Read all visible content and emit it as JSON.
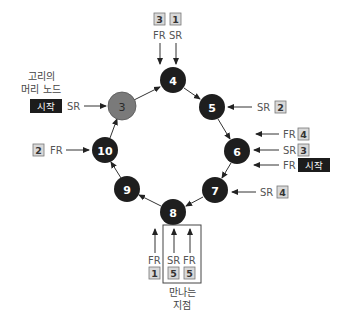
{
  "diagram": {
    "type": "cyclic-linked-list-floyd",
    "nodes": [
      {
        "id": "n3",
        "label": "3",
        "cx": 122,
        "cy": 106,
        "style": "start"
      },
      {
        "id": "n4",
        "label": "4",
        "cx": 173,
        "cy": 80,
        "style": "dark"
      },
      {
        "id": "n5",
        "label": "5",
        "cx": 212,
        "cy": 107,
        "style": "dark"
      },
      {
        "id": "n6",
        "label": "6",
        "cx": 237,
        "cy": 151,
        "style": "dark"
      },
      {
        "id": "n7",
        "label": "7",
        "cx": 215,
        "cy": 190,
        "style": "dark"
      },
      {
        "id": "n8",
        "label": "8",
        "cx": 173,
        "cy": 212,
        "style": "dark"
      },
      {
        "id": "n9",
        "label": "9",
        "cx": 127,
        "cy": 189,
        "style": "dark"
      },
      {
        "id": "n10",
        "label": "10",
        "cx": 105,
        "cy": 150,
        "style": "dark"
      }
    ],
    "edges": [
      [
        "n3",
        "n4"
      ],
      [
        "n4",
        "n5"
      ],
      [
        "n5",
        "n6"
      ],
      [
        "n6",
        "n7"
      ],
      [
        "n7",
        "n8"
      ],
      [
        "n8",
        "n9"
      ],
      [
        "n9",
        "n10"
      ],
      [
        "n10",
        "n3"
      ]
    ],
    "captions": {
      "loop_head_line1": "고리의",
      "loop_head_line2": "머리 노드",
      "meeting_point_line1": "만나는",
      "meeting_point_line2": "지점"
    },
    "pointers": {
      "n3_sr": {
        "label": "SR",
        "badge": "시작",
        "badge_style": "dark"
      },
      "n4_fr": {
        "label": "FR",
        "badge": "3",
        "badge_style": "light"
      },
      "n4_sr": {
        "label": "SR",
        "badge": "1",
        "badge_style": "light"
      },
      "n5_sr": {
        "label": "SR",
        "badge": "2",
        "badge_style": "light"
      },
      "n6_fr_a": {
        "label": "FR",
        "badge": "4",
        "badge_style": "light"
      },
      "n6_sr": {
        "label": "SR",
        "badge": "3",
        "badge_style": "light"
      },
      "n6_fr_b": {
        "label": "FR",
        "badge": "시작",
        "badge_style": "dark"
      },
      "n7_sr": {
        "label": "SR",
        "badge": "4",
        "badge_style": "light"
      },
      "n8_fr_a": {
        "label": "FR",
        "badge": "1",
        "badge_style": "light"
      },
      "n8_sr": {
        "label": "SR",
        "badge": "5",
        "badge_style": "light"
      },
      "n8_fr_b": {
        "label": "FR",
        "badge": "5",
        "badge_style": "light"
      },
      "n10_fr": {
        "label": "FR",
        "badge": "2",
        "badge_style": "light"
      }
    },
    "colors": {
      "node_dark": "#1e1e1e",
      "node_start": "#7a7a7a",
      "badge_light": "#d9d9d9",
      "badge_dark": "#1c1c1c",
      "text": "#555555"
    }
  }
}
